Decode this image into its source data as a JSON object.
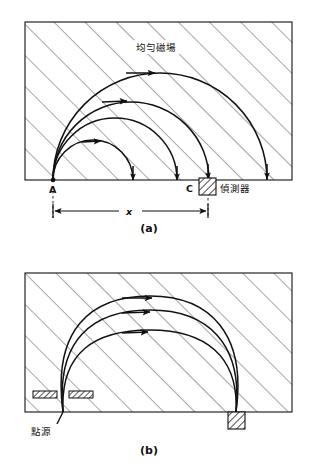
{
  "figure": {
    "title_visible": false,
    "background_color": "#ffffff",
    "ink_color": "#111111",
    "hatch_color": "#555555"
  },
  "panels": [
    {
      "id": "a",
      "caption": "(a)",
      "frame": {
        "x": 25,
        "y": 22,
        "width": 267,
        "height": 158
      },
      "field_label": "均勻磁場",
      "field_label_pos": {
        "x": 158,
        "y": 51
      },
      "source_label": "A",
      "source_label_pos": {
        "x": 49,
        "y": 193
      },
      "source_point": {
        "x": 53,
        "y": 180
      },
      "detector_label": "C",
      "detector_label_pos": {
        "x": 186,
        "y": 192
      },
      "detector_name": "偵測器",
      "detector_name_pos": {
        "x": 216,
        "y": 192
      },
      "detector_block": {
        "x": 199,
        "y": 178,
        "width": 17,
        "height": 17
      },
      "dimension_label": "x",
      "dimension_label_pos": {
        "x": 129,
        "y": 214
      },
      "dimension_line_y": 211,
      "dimension_from_x": 53,
      "dimension_to_x": 208,
      "trajectories": [
        {
          "name": "inner-arc",
          "radius": 40,
          "arrow_t": 0.4
        },
        {
          "name": "middle-arc",
          "radius": 62,
          "arrow_t": 0.4
        },
        {
          "name": "outer-arc",
          "radius": 78,
          "arrow_t": 0.4
        }
      ]
    },
    {
      "id": "b",
      "caption": "(b)",
      "frame": {
        "x": 25,
        "y": 273,
        "width": 267,
        "height": 139
      },
      "source_label": "點源",
      "source_label_pos": {
        "x": 31,
        "y": 432
      },
      "source_point": {
        "x": 63,
        "y": 412
      },
      "slit_left": {
        "x": 33,
        "y": 391,
        "width": 24,
        "height": 7
      },
      "slit_right": {
        "x": 69,
        "y": 391,
        "width": 24,
        "height": 7
      },
      "detector_block": {
        "x": 228,
        "y": 412,
        "width": 17,
        "height": 17
      },
      "trajectories": [
        {
          "name": "inner-arc",
          "height": 78,
          "arrow_t": 0.42
        },
        {
          "name": "middle-arc",
          "height": 98,
          "arrow_t": 0.42
        },
        {
          "name": "outer-arc",
          "height": 114,
          "arrow_t": 0.42
        }
      ]
    }
  ],
  "captions": {
    "a_pos": {
      "x": 140,
      "y": 228
    },
    "b_pos": {
      "x": 140,
      "y": 450
    }
  }
}
